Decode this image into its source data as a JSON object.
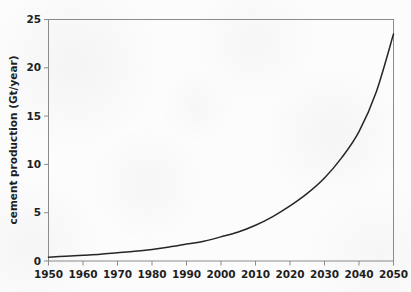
{
  "chart_data": {
    "type": "line",
    "title": "",
    "xlabel": "",
    "ylabel": "cement production (Gt/year)",
    "xlim": [
      1950,
      2050
    ],
    "ylim": [
      0,
      25
    ],
    "grid": false,
    "legend": null,
    "x_ticks": [
      "1950",
      "1960",
      "1970",
      "1980",
      "1990",
      "2000",
      "2010",
      "2020",
      "2030",
      "2040",
      "2050"
    ],
    "y_ticks": [
      "0",
      "5",
      "10",
      "15",
      "20",
      "25"
    ],
    "series": [
      {
        "name": "cement production",
        "x": [
          1950,
          1955,
          1960,
          1965,
          1970,
          1975,
          1980,
          1985,
          1990,
          1995,
          2000,
          2005,
          2010,
          2015,
          2020,
          2025,
          2030,
          2035,
          2040,
          2045,
          2050
        ],
        "values": [
          0.4,
          0.5,
          0.6,
          0.7,
          0.85,
          1.0,
          1.2,
          1.45,
          1.75,
          2.05,
          2.5,
          3.0,
          3.7,
          4.6,
          5.7,
          7.0,
          8.6,
          10.7,
          13.4,
          17.5,
          23.5
        ]
      }
    ]
  },
  "axes": {
    "y_axis_title": "cement production (Gt/year)"
  }
}
